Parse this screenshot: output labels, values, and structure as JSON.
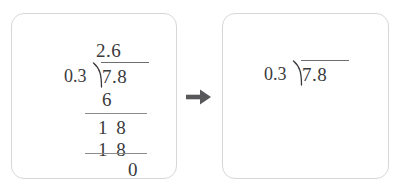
{
  "background_color": "#ffffff",
  "card_border_color": "#d7d7d9",
  "ink_color": "#3a3a3c",
  "rule_color": "#8a8a8d",
  "arrow_color": "#58585b",
  "arrow": {
    "icon": "arrow-right-icon",
    "label": "→"
  },
  "left_panel": {
    "title": "completed-long-division",
    "quotient": "2.6",
    "divisor": "0.3",
    "dividend": "7.8",
    "steps": [
      {
        "label": "6",
        "name": "first-product"
      },
      {
        "label": "1 8",
        "name": "first-difference"
      },
      {
        "label": "1 8",
        "name": "second-product"
      }
    ],
    "remainder": "0"
  },
  "right_panel": {
    "title": "division-setup-only",
    "divisor": "0.3",
    "dividend": "7.8"
  },
  "math": {
    "expression": "7.8 ÷ 0.3 = 2.6",
    "divisor_value": 0.3,
    "dividend_value": 7.8,
    "quotient_value": 2.6,
    "remainder_value": 0
  }
}
